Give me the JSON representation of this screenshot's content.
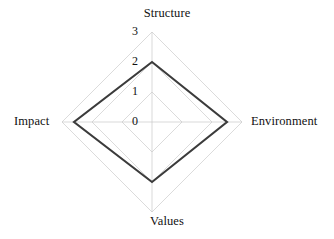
{
  "chart_data": {
    "type": "radar",
    "title": "",
    "categories": [
      "Structure",
      "Environment",
      "Values",
      "Impact"
    ],
    "series": [
      {
        "name": "",
        "values": [
          2.0,
          2.5,
          2.0,
          2.6
        ]
      }
    ],
    "tick_labels": [
      "0",
      "1",
      "2",
      "3"
    ],
    "tick_values": [
      0,
      1,
      2,
      3
    ],
    "rlim": [
      0,
      3
    ],
    "grid": true,
    "legend": "none",
    "axis_label_positions": {
      "Structure": "top",
      "Environment": "right",
      "Values": "bottom",
      "Impact": "left"
    },
    "tick_axis": "Structure",
    "colors": {
      "background": "#ffffff",
      "grid": "#c8c8c8",
      "series_line": "#3b3b3b",
      "text": "#111111"
    }
  },
  "axis_labels": {
    "top": "Structure",
    "right": "Environment",
    "bottom": "Values",
    "left": "Impact"
  },
  "ticks": {
    "t3": "3",
    "t2": "2",
    "t1": "1",
    "t0": "0"
  }
}
